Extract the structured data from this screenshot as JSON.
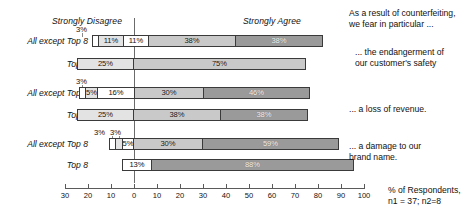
{
  "chart_data": {
    "type": "bar",
    "subtype": "diverging-stacked-bar",
    "title": "",
    "xlabel": "% of Respondents",
    "ylabel": "",
    "xlim": [
      -30,
      100
    ],
    "xticks": [
      -30,
      -20,
      -10,
      0,
      10,
      20,
      30,
      40,
      50,
      60,
      70,
      80,
      90,
      100
    ],
    "xticklabels": [
      "30",
      "20",
      "10",
      "0",
      "10",
      "20",
      "30",
      "40",
      "50",
      "60",
      "70",
      "80",
      "90",
      "100"
    ],
    "grid": false,
    "legend_position": "none",
    "scale_anchors": {
      "disagree_label": "Strongly Disagree",
      "agree_label": "Strongly Agree"
    },
    "categories": [
      "All except Top 8",
      "Top 8",
      "All except Top 8",
      "Top 8",
      "All except Top 8",
      "Top 8"
    ],
    "groups": [
      {
        "question": "... the endangerment of our customer's safety",
        "rows": [
          {
            "label": "All except Top 8",
            "negative": [
              {
                "value": 3,
                "display": "3%",
                "inline": false
              },
              {
                "value": 11,
                "display": "11%",
                "inline": true
              },
              {
                "value": 11,
                "display": "11%",
                "inline": true
              }
            ],
            "positive": [
              {
                "value": 38,
                "display": "38%",
                "inline": true
              },
              {
                "value": 38,
                "display": "38%",
                "inline": true
              }
            ]
          },
          {
            "label": "Top 8",
            "negative": [
              {
                "value": 25,
                "display": "25%",
                "inline": true
              }
            ],
            "positive": [
              {
                "value": 75,
                "display": "75%",
                "inline": true
              }
            ]
          }
        ]
      },
      {
        "question": "... a loss of revenue",
        "rows": [
          {
            "label": "All except Top 8",
            "negative": [
              {
                "value": 3,
                "display": "3%",
                "inline": false
              },
              {
                "value": 5,
                "display": "5%",
                "inline": true
              },
              {
                "value": 16,
                "display": "16%",
                "inline": true
              }
            ],
            "positive": [
              {
                "value": 30,
                "display": "30%",
                "inline": true
              },
              {
                "value": 46,
                "display": "46%",
                "inline": true
              }
            ]
          },
          {
            "label": "Top 8",
            "negative": [
              {
                "value": 25,
                "display": "25%",
                "inline": true
              }
            ],
            "positive": [
              {
                "value": 38,
                "display": "38%",
                "inline": true
              },
              {
                "value": 38,
                "display": "38%",
                "inline": true
              }
            ]
          }
        ]
      },
      {
        "question": "... a damage to our brand name",
        "rows": [
          {
            "label": "All except Top 8",
            "negative": [
              {
                "value": 3,
                "display": "3%",
                "inline": false
              },
              {
                "value": 3,
                "display": "3%",
                "inline": false
              },
              {
                "value": 5,
                "display": "5%",
                "inline": true
              }
            ],
            "positive": [
              {
                "value": 30,
                "display": "30%",
                "inline": true
              },
              {
                "value": 59,
                "display": "59%",
                "inline": true
              }
            ]
          },
          {
            "label": "Top 8",
            "negative": [
              {
                "value": 13,
                "display": "13%",
                "inline": true
              }
            ],
            "positive": [
              {
                "value": 88,
                "display": "88%",
                "inline": true
              }
            ]
          }
        ]
      }
    ],
    "annotations": [
      "As a result of counterfeiting, we fear in particular ...",
      "% of Respondents, n1 = 37; n2=8"
    ]
  },
  "header": {
    "strongly_disagree": "Strongly Disagree",
    "strongly_agree": "Strongly Agree",
    "intro": "As a result of counterfeiting,\nwe fear in particular ..."
  },
  "rows": [
    {
      "label": "All except Top 8",
      "tiny": [
        "3%"
      ],
      "segments": [
        {
          "display": "3%",
          "inline": false
        },
        {
          "display": "11%",
          "inline": true
        },
        {
          "display": "11%",
          "inline": true
        },
        {
          "display": "38%",
          "inline": true
        },
        {
          "display": "38%",
          "inline": true
        }
      ]
    },
    {
      "label": "Top 8",
      "tiny": [],
      "segments": [
        {
          "display": "25%",
          "inline": true
        },
        {
          "display": "75%",
          "inline": true
        }
      ]
    },
    {
      "label": "All except Top 8",
      "tiny": [
        "3%"
      ],
      "segments": [
        {
          "display": "3%",
          "inline": false
        },
        {
          "display": "5%",
          "inline": true
        },
        {
          "display": "16%",
          "inline": true
        },
        {
          "display": "30%",
          "inline": true
        },
        {
          "display": "46%",
          "inline": true
        }
      ]
    },
    {
      "label": "Top 8",
      "tiny": [],
      "segments": [
        {
          "display": "25%",
          "inline": true
        },
        {
          "display": "38%",
          "inline": true
        },
        {
          "display": "38%",
          "inline": true
        }
      ]
    },
    {
      "label": "All except Top 8",
      "tiny": [
        "3%",
        "3%"
      ],
      "segments": [
        {
          "display": "3%",
          "inline": false
        },
        {
          "display": "3%",
          "inline": false
        },
        {
          "display": "5%",
          "inline": true
        },
        {
          "display": "30%",
          "inline": true
        },
        {
          "display": "59%",
          "inline": true
        }
      ]
    },
    {
      "label": "Top 8",
      "tiny": [],
      "segments": [
        {
          "display": "13%",
          "inline": true
        },
        {
          "display": "88%",
          "inline": true
        }
      ]
    }
  ],
  "row_labels": {
    "r0": "All except Top 8",
    "r1": "Top 8",
    "r2": "All except Top 8",
    "r3": "Top 8",
    "r4": "All except Top 8",
    "r5": "Top 8"
  },
  "bar_labels": {
    "r0": {
      "s0": "3%",
      "s1": "11%",
      "s2": "11%",
      "s3": "38%",
      "s4": "38%"
    },
    "r1": {
      "s0": "25%",
      "s1": "75%"
    },
    "r2": {
      "s0": "3%",
      "s1": "5%",
      "s2": "16%",
      "s3": "30%",
      "s4": "46%"
    },
    "r3": {
      "s0": "25%",
      "s1": "38%",
      "s2": "38%"
    },
    "r4": {
      "s0": "3%",
      "s1": "3%",
      "s2": "5%",
      "s3": "30%",
      "s4": "59%"
    },
    "r5": {
      "s0": "13%",
      "s1": "88%"
    }
  },
  "tiny_callouts": {
    "r0a": "3%",
    "r2a": "3%",
    "r4a": "3%",
    "r4b": "3%"
  },
  "questions": {
    "q1": "... the endangerment of\n   our customer's safety",
    "q2": "... a loss of revenue.",
    "q3": "... a damage to our\n   brand name."
  },
  "axis": {
    "ticks": [
      "30",
      "20",
      "10",
      "0",
      "10",
      "20",
      "30",
      "40",
      "50",
      "60",
      "70",
      "80",
      "90",
      "100"
    ],
    "caption": "% of Respondents,\nn1 = 37; n2=8"
  },
  "colors": {
    "seg_strongly_disagree": "#ffffff",
    "seg_disagree": "#e3e3e3",
    "seg_neutral": "#ffffff",
    "seg_agree": "#c9c9c9",
    "seg_strongly_agree": "#9a9a9a",
    "stroke": "#3a3a3a",
    "axis": "#5a5a5a"
  }
}
